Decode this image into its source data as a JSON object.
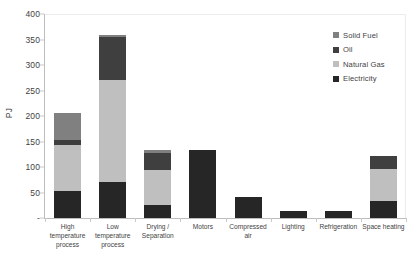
{
  "chart_data": {
    "type": "bar",
    "subtype": "stacked-bar",
    "title": "",
    "xlabel": "",
    "ylabel": "PJ",
    "ylim": [
      0,
      400
    ],
    "yticks": [
      0,
      50,
      100,
      150,
      200,
      250,
      300,
      350,
      400
    ],
    "ytick_labels": [
      "-",
      "50",
      "100",
      "150",
      "200",
      "250",
      "300",
      "350",
      "400"
    ],
    "grid": false,
    "legend_position": "right",
    "categories": [
      "High temperature process",
      "Low temperature process",
      "Drying / Separation",
      "Motors",
      "Compressed air",
      "Lighting",
      "Refrigeration",
      "Space heating"
    ],
    "category_lines": [
      [
        "High",
        "temperature",
        "process"
      ],
      [
        "Low",
        "temperature",
        "process"
      ],
      [
        "Drying /",
        "Separation"
      ],
      [
        "Motors"
      ],
      [
        "Compressed",
        "air"
      ],
      [
        "Lighting"
      ],
      [
        "Refrigeration"
      ],
      [
        "Space heating"
      ]
    ],
    "series": [
      {
        "name": "Electricity",
        "color": "#262626",
        "values": [
          53,
          70,
          25,
          133,
          42,
          13,
          13,
          33
        ]
      },
      {
        "name": "Natural Gas",
        "color": "#bfbfbf",
        "values": [
          90,
          200,
          70,
          0,
          0,
          0,
          0,
          64
        ]
      },
      {
        "name": "Oil",
        "color": "#3f3f3f",
        "values": [
          10,
          85,
          33,
          0,
          0,
          0,
          0,
          25
        ]
      },
      {
        "name": "Solid Fuel",
        "color": "#808080",
        "values": [
          52,
          3,
          5,
          0,
          0,
          0,
          0,
          0
        ]
      }
    ],
    "stack_order_bottom_to_top": [
      "Electricity",
      "Natural Gas",
      "Oil",
      "Solid Fuel"
    ],
    "totals": [
      205,
      358,
      133,
      133,
      42,
      13,
      13,
      122
    ],
    "legend_entries": [
      {
        "label": "Solid Fuel",
        "color": "#808080"
      },
      {
        "label": "Oil",
        "color": "#3f3f3f"
      },
      {
        "label": "Natural Gas",
        "color": "#bfbfbf"
      },
      {
        "label": "Electricity",
        "color": "#262626"
      }
    ]
  }
}
